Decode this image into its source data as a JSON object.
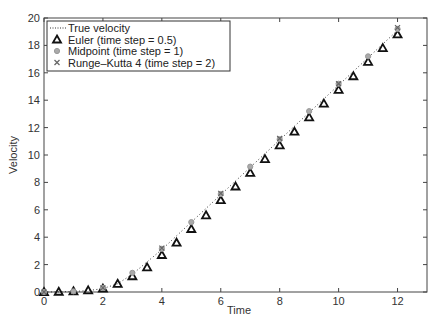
{
  "chart_data": {
    "type": "line",
    "title": "",
    "xlabel": "Time",
    "ylabel": "Velocity",
    "xlim": [
      0,
      13
    ],
    "ylim": [
      0,
      20
    ],
    "xticks": [
      0,
      2,
      4,
      6,
      8,
      10,
      12
    ],
    "yticks": [
      0,
      2,
      4,
      6,
      8,
      10,
      12,
      14,
      16,
      18,
      20
    ],
    "grid": false,
    "legend_position": "top-left",
    "series": [
      {
        "name": "True velocity",
        "style": "dotted-line",
        "x": [
          0,
          0.5,
          1,
          1.5,
          2,
          2.5,
          3,
          3.5,
          4,
          5,
          6,
          7,
          8,
          9,
          10,
          11,
          12
        ],
        "y": [
          0,
          0.01,
          0.04,
          0.1,
          0.25,
          0.6,
          1.3,
          2.2,
          3.1,
          5.1,
          7.1,
          9.1,
          11.1,
          13.1,
          15.1,
          17.1,
          19.1
        ]
      },
      {
        "name": "Euler (time step = 0.5)",
        "style": "triangle",
        "x": [
          0,
          0.5,
          1,
          1.5,
          2,
          2.5,
          3,
          3.5,
          4,
          4.5,
          5,
          5.5,
          6,
          6.5,
          7,
          7.5,
          8,
          8.5,
          9,
          9.5,
          10,
          10.5,
          11,
          11.5,
          12
        ],
        "y": [
          0,
          0.02,
          0.05,
          0.12,
          0.25,
          0.6,
          1.15,
          1.8,
          2.7,
          3.6,
          4.6,
          5.6,
          6.7,
          7.7,
          8.7,
          9.7,
          10.7,
          11.7,
          12.75,
          13.75,
          14.75,
          15.75,
          16.8,
          17.8,
          18.8
        ]
      },
      {
        "name": "Midpoint (time step = 1)",
        "style": "circle",
        "x": [
          0,
          1,
          2,
          3,
          4,
          5,
          6,
          7,
          8,
          9,
          10,
          11,
          12
        ],
        "y": [
          0,
          0.05,
          0.3,
          1.4,
          3.15,
          5.1,
          7.15,
          9.15,
          11.15,
          13.2,
          15.2,
          17.2,
          19.2
        ]
      },
      {
        "name": "Runge–Kutta 4 (time step = 2)",
        "style": "cross",
        "x": [
          0,
          2,
          4,
          6,
          8,
          10,
          12
        ],
        "y": [
          0,
          0.3,
          3.2,
          7.2,
          11.2,
          15.2,
          19.3
        ]
      }
    ]
  }
}
